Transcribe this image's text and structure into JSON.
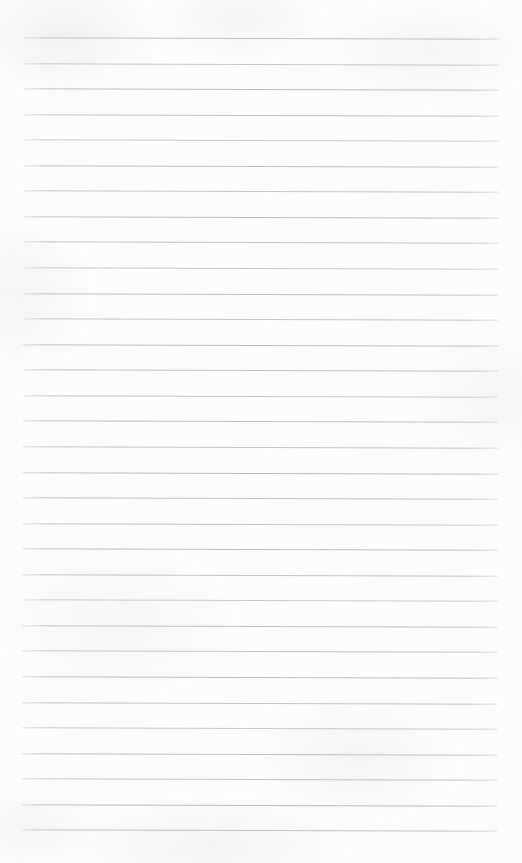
{
  "document": {
    "type": "ruled-paper-scan",
    "title": "Blank Ruled Paper",
    "page_width": 522,
    "page_height": 863,
    "background_color": "#fdfdfd",
    "has_text_content": false,
    "has_margin_rule": false,
    "has_handwriting": false,
    "body_text": ""
  },
  "ruling": {
    "line_color": "#b8b8bc",
    "line_thickness_px": 1,
    "line_count": 32,
    "line_spacing_px": 25.55,
    "first_line_y": 38,
    "last_line_y": 830,
    "left_margin_x": 23,
    "right_margin_x": 498,
    "line_length_px": 475,
    "skew_degrees": 0.16,
    "lines": [
      {
        "index": 1,
        "y": 38.0,
        "x1": 23,
        "x2": 498
      },
      {
        "index": 2,
        "y": 63.6,
        "x1": 23,
        "x2": 498
      },
      {
        "index": 3,
        "y": 89.1,
        "x1": 23,
        "x2": 498
      },
      {
        "index": 4,
        "y": 114.7,
        "x1": 23,
        "x2": 498
      },
      {
        "index": 5,
        "y": 140.2,
        "x1": 23,
        "x2": 498
      },
      {
        "index": 6,
        "y": 165.8,
        "x1": 23,
        "x2": 498
      },
      {
        "index": 7,
        "y": 191.3,
        "x1": 23,
        "x2": 498
      },
      {
        "index": 8,
        "y": 216.9,
        "x1": 23,
        "x2": 498
      },
      {
        "index": 9,
        "y": 242.4,
        "x1": 23,
        "x2": 498
      },
      {
        "index": 10,
        "y": 268.0,
        "x1": 23,
        "x2": 498
      },
      {
        "index": 11,
        "y": 293.6,
        "x1": 23,
        "x2": 498
      },
      {
        "index": 12,
        "y": 319.1,
        "x1": 23,
        "x2": 498
      },
      {
        "index": 13,
        "y": 344.7,
        "x1": 23,
        "x2": 498
      },
      {
        "index": 14,
        "y": 370.2,
        "x1": 23,
        "x2": 498
      },
      {
        "index": 15,
        "y": 395.8,
        "x1": 23,
        "x2": 498
      },
      {
        "index": 16,
        "y": 421.3,
        "x1": 23,
        "x2": 498
      },
      {
        "index": 17,
        "y": 446.9,
        "x1": 23,
        "x2": 498
      },
      {
        "index": 18,
        "y": 472.5,
        "x1": 23,
        "x2": 498
      },
      {
        "index": 19,
        "y": 498.0,
        "x1": 23,
        "x2": 498
      },
      {
        "index": 20,
        "y": 523.6,
        "x1": 23,
        "x2": 498
      },
      {
        "index": 21,
        "y": 549.1,
        "x1": 23,
        "x2": 498
      },
      {
        "index": 22,
        "y": 574.7,
        "x1": 23,
        "x2": 498
      },
      {
        "index": 23,
        "y": 600.2,
        "x1": 23,
        "x2": 498
      },
      {
        "index": 24,
        "y": 625.8,
        "x1": 23,
        "x2": 498
      },
      {
        "index": 25,
        "y": 651.4,
        "x1": 23,
        "x2": 498
      },
      {
        "index": 26,
        "y": 676.9,
        "x1": 23,
        "x2": 498
      },
      {
        "index": 27,
        "y": 702.5,
        "x1": 23,
        "x2": 498
      },
      {
        "index": 28,
        "y": 728.0,
        "x1": 23,
        "x2": 498
      },
      {
        "index": 29,
        "y": 753.6,
        "x1": 23,
        "x2": 498
      },
      {
        "index": 30,
        "y": 779.1,
        "x1": 23,
        "x2": 498
      },
      {
        "index": 31,
        "y": 804.7,
        "x1": 23,
        "x2": 498
      },
      {
        "index": 32,
        "y": 830.2,
        "x1": 23,
        "x2": 498
      }
    ]
  }
}
